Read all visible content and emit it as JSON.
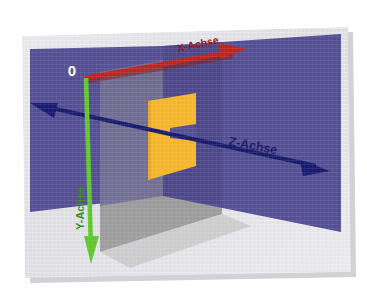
{
  "figure": {
    "kind": "3d-coordinate-system-diagram",
    "language": "de",
    "origin_label": "0",
    "canvas": {
      "width": 367,
      "height": 296
    }
  },
  "colors": {
    "page_background": "#ffffff",
    "image_background": "#dedee2",
    "image_background_2": "#e8e8ec",
    "plane_purple": "#544e93",
    "plane_purple_dark": "#474182",
    "plane_gray": "#8e8e8e",
    "plane_gray_light": "#b9b9b9",
    "rect_yellow": "#f5b52a",
    "rect_yellow_shade": "#e8a520",
    "axis_x": "#c0231c",
    "axis_x_shadow": "#8d1a14",
    "axis_y": "#5fc72c",
    "axis_z": "#181a6e",
    "label_x": "#8d1410",
    "label_y": "#2e8f12",
    "label_z": "#181a6e",
    "origin_text": "#ffffff",
    "border_shadow": "#c9c9cf"
  },
  "axes": [
    {
      "id": "x",
      "label": "X-Achse",
      "color": "#c0231c",
      "label_color": "#8d1410",
      "arrowheads": "single",
      "direction": "up-right",
      "label_rotation_deg": -12
    },
    {
      "id": "y",
      "label": "Y-Achse",
      "color": "#5fc72c",
      "label_color": "#2e8f12",
      "arrowheads": "single",
      "direction": "down",
      "label_rotation_deg": -90
    },
    {
      "id": "z",
      "label": "Z-Achse",
      "color": "#181a6e",
      "label_color": "#181a6e",
      "arrowheads": "double",
      "direction": "left-right",
      "label_rotation_deg": 11
    }
  ],
  "planes": [
    {
      "id": "xy-plane",
      "name": "graue Ebene",
      "color": "#8e8e8e"
    },
    {
      "id": "xz-plane",
      "name": "violette Ebene",
      "color": "#544e93"
    },
    {
      "id": "yellow-rect",
      "name": "gelbe Fläche",
      "color": "#f5b52a"
    }
  ]
}
